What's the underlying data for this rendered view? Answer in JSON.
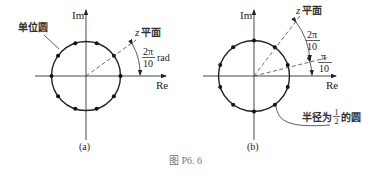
{
  "figure": {
    "caption": "图 P6. 6",
    "panel_a": {
      "label": "(a)",
      "axis_re": "Re",
      "axis_im": "Im",
      "circle_label": "单位圆",
      "plane_label_z": "z",
      "plane_label_rest": "平面",
      "angle_num": "2π",
      "angle_den": "10",
      "angle_unit": "rad",
      "radius_description": "unit circle, radius 1",
      "num_points": 10,
      "point_angle_offset_deg": 0
    },
    "panel_b": {
      "label": "(b)",
      "axis_re": "Re",
      "axis_im": "Im",
      "plane_label_z": "z",
      "plane_label_rest": "平面",
      "angle1_num": "2π",
      "angle1_den": "10",
      "angle2_num": "π",
      "angle2_den": "10",
      "circle_label_prefix": "半径为",
      "circle_label_frac_num": "1",
      "circle_label_frac_den": "2",
      "circle_label_suffix": "的圆",
      "num_points": 10,
      "point_angle_offset_deg": 18
    },
    "colors": {
      "line": "#222222",
      "caption": "#777777",
      "background": "#ffffff"
    }
  }
}
